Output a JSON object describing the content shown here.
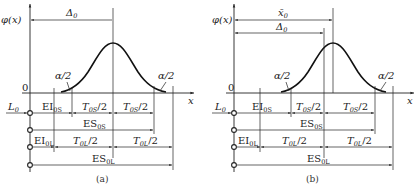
{
  "figure": {
    "panels": [
      {
        "id": "a",
        "caption": "(a)",
        "y_axis_label": "φ(x)",
        "x_axis_label": "x",
        "origin_label": "0",
        "top_dimensions": [
          {
            "label": "Δ",
            "sub": "0"
          }
        ],
        "tail_labels": [
          "α/2",
          "α/2"
        ],
        "input_label": {
          "main": "L",
          "sub": "0"
        },
        "rows": {
          "EI0S": {
            "main": "EI",
            "sub": "0S"
          },
          "T0S_left": {
            "main": "T",
            "sub": "0S",
            "suffix": "/2"
          },
          "T0S_right": {
            "main": "T",
            "sub": "0S",
            "suffix": "/2"
          },
          "ES0S": {
            "main": "ES",
            "sub": "0S"
          },
          "EI0L": {
            "main": "EI",
            "sub": "0L"
          },
          "T0L_left": {
            "main": "T",
            "sub": "0L",
            "suffix": "/2"
          },
          "T0L_right": {
            "main": "T",
            "sub": "0L",
            "suffix": "/2"
          },
          "ES0L": {
            "main": "ES",
            "sub": "0L"
          }
        }
      },
      {
        "id": "b",
        "caption": "(b)",
        "y_axis_label": "φ(x)",
        "x_axis_label": "x",
        "origin_label": "0",
        "top_dimensions": [
          {
            "label": "x̄",
            "sub": "0"
          },
          {
            "label": "Δ",
            "sub": "0"
          }
        ],
        "tail_labels": [
          "α/2",
          "α/2"
        ],
        "input_label": {
          "main": "L",
          "sub": "0"
        },
        "rows": {
          "EI0S": {
            "main": "EI",
            "sub": "0S"
          },
          "T0S_left": {
            "main": "T",
            "sub": "0S",
            "suffix": "/2"
          },
          "T0S_right": {
            "main": "T",
            "sub": "0S",
            "suffix": "/2"
          },
          "ES0S": {
            "main": "ES",
            "sub": "0S"
          },
          "EI0L": {
            "main": "EI",
            "sub": "0L"
          },
          "T0L_left": {
            "main": "T",
            "sub": "0L",
            "suffix": "/2"
          },
          "T0L_right": {
            "main": "T",
            "sub": "0L",
            "suffix": "/2"
          },
          "ES0L": {
            "main": "ES",
            "sub": "0L"
          }
        }
      }
    ]
  }
}
